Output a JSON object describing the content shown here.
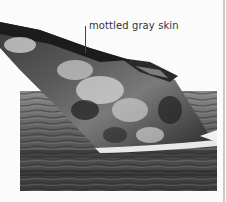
{
  "figure": {
    "annotation": {
      "label": "mottled gray skin"
    },
    "colors": {
      "background": "#fbfbfb",
      "water_dark": "#2a2a2a",
      "water_mid": "#6d6d6d",
      "whale_dark": "#1c1c1c",
      "whale_light": "#d8d8d8",
      "rule": "#c8c8c8"
    }
  }
}
